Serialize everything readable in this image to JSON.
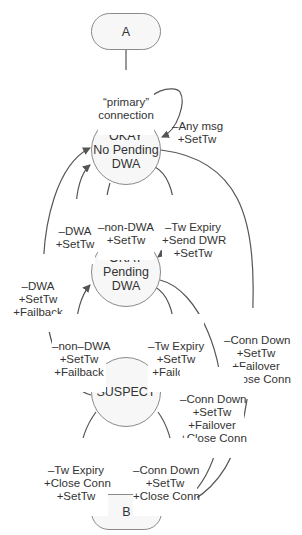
{
  "nodes": {
    "a": {
      "label": "A"
    },
    "ok_no_pending": {
      "line1": "OKAY",
      "line2": "No Pending",
      "line3": "DWA"
    },
    "ok_pending": {
      "line1": "OKAY",
      "line2": "Pending",
      "line3": "DWA"
    },
    "suspect": {
      "label": "SUSPECT"
    },
    "b": {
      "label": "B"
    }
  },
  "edges": {
    "a_to_ok": {
      "l1": "“primary”",
      "l2": "connection"
    },
    "self_loop": {
      "l1": "–Any msg",
      "l2": "+SetTw"
    },
    "pending_to_nopending_dwa": {
      "l1": "–DWA",
      "l2": "+SetTw"
    },
    "nopending_to_pending_nondwa": {
      "l1": "–non-DWA",
      "l2": "+SetTw"
    },
    "nopending_to_pending_expiry": {
      "l1": "–Tw Expiry",
      "l2": "+Send DWR",
      "l3": "+SetTw"
    },
    "suspect_to_nopending": {
      "l1": "–DWA",
      "l2": "+SetTw",
      "l3": "+Failback"
    },
    "suspect_to_pending": {
      "l1": "–non–DWA",
      "l2": "+SetTw",
      "l3": "+Failback"
    },
    "pending_to_suspect": {
      "l1": "–Tw Expiry",
      "l2": "+SetTw",
      "l3": "+Failover"
    },
    "nopending_to_b": {
      "l1": "–Conn Down",
      "l2": "+SetTw",
      "l3": "+Failover",
      "l4": "+Close Conn"
    },
    "pending_to_b": {
      "l1": "–Conn Down",
      "l2": "+SetTw",
      "l3": "+Failover",
      "l4": "+Close Conn"
    },
    "suspect_to_b_expiry": {
      "l1": "–Tw Expiry",
      "l2": "+Close Conn",
      "l3": "+SetTw"
    },
    "suspect_to_b_conndown": {
      "l1": "–Conn Down",
      "l2": "+SetTw",
      "l3": "+Close Conn"
    }
  },
  "colors": {
    "line": "#555555",
    "node_border": "#8a8a8a",
    "node_fill": "#f7f7f7"
  }
}
